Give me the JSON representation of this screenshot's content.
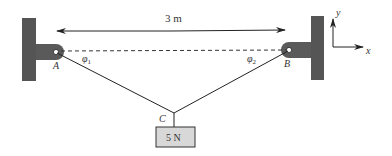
{
  "diagram": {
    "distance_label": "3 m",
    "points": {
      "A": "A",
      "B": "B",
      "C": "C"
    },
    "angles": {
      "phi1": "φ",
      "phi1_sub": "1",
      "phi2": "φ",
      "phi2_sub": "2"
    },
    "weight_label": "5 N",
    "axes": {
      "x": "x",
      "y": "y"
    },
    "colors": {
      "wall": "#555555",
      "bracket": "#5a5a5a",
      "line": "#222222",
      "weight_fill": "#d8d8d8"
    }
  }
}
